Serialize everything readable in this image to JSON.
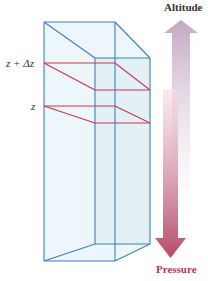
{
  "labels": {
    "altitude": "Altitude",
    "pressure": "Pressure",
    "upper_level": "z + Δz",
    "lower_level": "z"
  },
  "colors": {
    "box_edge": "#3f7fc4",
    "box_fill": "#e6f2f8",
    "plane_edge": "#c8384f",
    "altitude_arrow": "#cbb0c8",
    "pressure_arrow": "#b8506e"
  }
}
